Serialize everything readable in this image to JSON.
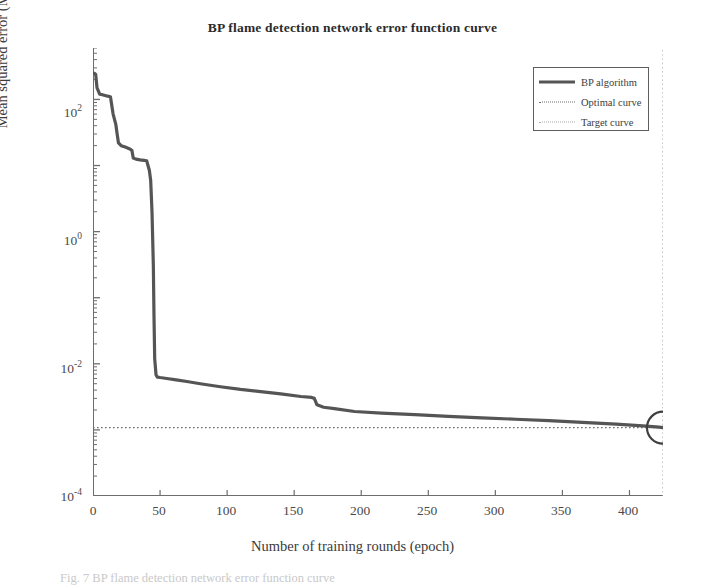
{
  "chart_data": {
    "type": "line",
    "title": "BP flame detection network error function curve",
    "xlabel": "Number of training rounds (epoch)",
    "ylabel": "Mean squared error (MSE)",
    "yscale": "log",
    "xlim": [
      0,
      425
    ],
    "ylim": [
      0.0001,
      600
    ],
    "grid": false,
    "legend_position": "top-right",
    "xticks": [
      0,
      50,
      100,
      150,
      200,
      250,
      300,
      350,
      400
    ],
    "xtick_labels": [
      "0",
      "50",
      "100",
      "150",
      "200",
      "250",
      "300",
      "350",
      "400"
    ],
    "yticks": [
      100,
      1,
      0.01,
      0.0001
    ],
    "ytick_labels": [
      "10",
      "10",
      "10",
      "10"
    ],
    "ytick_exponents": [
      "2",
      "0",
      "-2",
      "-4"
    ],
    "series": [
      {
        "name": "BP algorithm",
        "style": "solid",
        "color": "#555555",
        "width": 3.2,
        "x": [
          0,
          1,
          2,
          3,
          5,
          7,
          9,
          11,
          13,
          15,
          17,
          18,
          19,
          21,
          24,
          27,
          29,
          30,
          32,
          35,
          38,
          40,
          42,
          43,
          44,
          45,
          45.5,
          46,
          47,
          48,
          50,
          55,
          62,
          70,
          80,
          95,
          110,
          125,
          140,
          155,
          163,
          165,
          167,
          172,
          180,
          195,
          215,
          240,
          265,
          290,
          315,
          340,
          365,
          390,
          410,
          422,
          425
        ],
        "y": [
          250,
          248,
          240,
          150,
          120,
          118,
          115,
          112,
          110,
          60,
          42,
          30,
          22,
          20,
          19,
          18,
          17,
          13,
          12.5,
          12.2,
          12.0,
          11.8,
          8.5,
          6.0,
          2.0,
          0.3,
          0.05,
          0.012,
          0.0068,
          0.0063,
          0.0062,
          0.006,
          0.0057,
          0.0054,
          0.005,
          0.0045,
          0.0041,
          0.0038,
          0.0035,
          0.0032,
          0.0031,
          0.003,
          0.0024,
          0.0022,
          0.0021,
          0.0019,
          0.0018,
          0.0017,
          0.0016,
          0.00152,
          0.00145,
          0.00138,
          0.0013,
          0.00122,
          0.00115,
          0.0011,
          0.00108
        ]
      },
      {
        "name": "Optimal curve",
        "style": "dotted",
        "color": "#6a6a6a",
        "orientation": "horizontal",
        "value": 0.00108
      },
      {
        "name": "Target curve",
        "style": "dotted",
        "color": "#a8a8a8",
        "orientation": "vertical",
        "value": 425
      }
    ],
    "annotations": [
      {
        "type": "circle-marker",
        "x": 425,
        "y": 0.00108,
        "radius_px": 16,
        "note": "convergence point highlighted where BP curve meets target curve"
      }
    ]
  },
  "legend": {
    "items": [
      {
        "label": "BP algorithm",
        "key": "solid-line-key"
      },
      {
        "label": "Optimal curve",
        "key": "dotted-line-key"
      },
      {
        "label": "Target curve",
        "key": "light-dotted-line-key"
      }
    ]
  },
  "caption": {
    "text": "Fig. 7  BP flame detection network error function curve"
  }
}
